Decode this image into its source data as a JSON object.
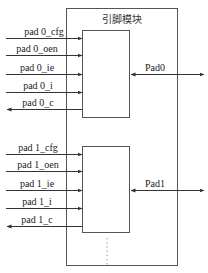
{
  "module": {
    "title": "引脚模块"
  },
  "groups": [
    {
      "pad_label": "Pad0",
      "signals": [
        {
          "label": "pad 0_cfg",
          "direction": "in"
        },
        {
          "label": "pad 0_oen",
          "direction": "in"
        },
        {
          "label": "pad 0_ie",
          "direction": "in"
        },
        {
          "label": "pad 0_i",
          "direction": "in"
        },
        {
          "label": "pad 0_c",
          "direction": "out"
        }
      ]
    },
    {
      "pad_label": "Pad1",
      "signals": [
        {
          "label": "pad 1_cfg",
          "direction": "in"
        },
        {
          "label": "pad 1_oen",
          "direction": "in"
        },
        {
          "label": "pad 1_ie",
          "direction": "in"
        },
        {
          "label": "pad 1_i",
          "direction": "in"
        },
        {
          "label": "pad 1_c",
          "direction": "out"
        }
      ]
    }
  ],
  "continuation": "⋮",
  "colors": {
    "line": "#333333",
    "box": "#555555",
    "background": "#ffffff"
  }
}
